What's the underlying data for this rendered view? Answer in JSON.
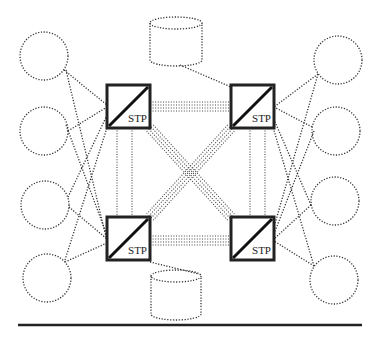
{
  "diagram": {
    "type": "network-topology",
    "node_label": "STP",
    "stp_nodes": [
      {
        "id": "stp-top-left",
        "label": "STP",
        "x": 107,
        "y": 85,
        "size": 43
      },
      {
        "id": "stp-top-right",
        "label": "STP",
        "x": 231,
        "y": 85,
        "size": 43
      },
      {
        "id": "stp-bottom-left",
        "label": "STP",
        "x": 107,
        "y": 217,
        "size": 43
      },
      {
        "id": "stp-bottom-right",
        "label": "STP",
        "x": 231,
        "y": 217,
        "size": 43
      }
    ],
    "endpoints_left": [
      {
        "cx": 44,
        "cy": 56,
        "r": 24
      },
      {
        "cx": 44,
        "cy": 131,
        "r": 24
      },
      {
        "cx": 45,
        "cy": 205,
        "r": 24
      },
      {
        "cx": 47,
        "cy": 278,
        "r": 24
      }
    ],
    "endpoints_right": [
      {
        "cx": 338,
        "cy": 60,
        "r": 24
      },
      {
        "cx": 336,
        "cy": 131,
        "r": 24
      },
      {
        "cx": 335,
        "cy": 201,
        "r": 24
      },
      {
        "cx": 334,
        "cy": 280,
        "r": 24
      }
    ],
    "databases": [
      {
        "id": "db-top",
        "cx": 176,
        "top": 23,
        "bottom": 60,
        "rx": 26,
        "ry": 6,
        "connects_to": "stp-top-right"
      },
      {
        "id": "db-bottom",
        "cx": 176,
        "top": 276,
        "bottom": 314,
        "rx": 25,
        "ry": 6,
        "connects_to": "stp-bottom-left"
      }
    ],
    "link_styles": {
      "quad_link": "STP-STP links drawn as 4 parallel dotted lines",
      "single_link": "endpoint-STP links drawn as single dotted lines"
    },
    "colors": {
      "stroke": "#222222",
      "dotted": "#333333",
      "background": "#ffffff"
    },
    "footer_rule": {
      "x1": 18,
      "x2": 362,
      "y": 325
    }
  }
}
